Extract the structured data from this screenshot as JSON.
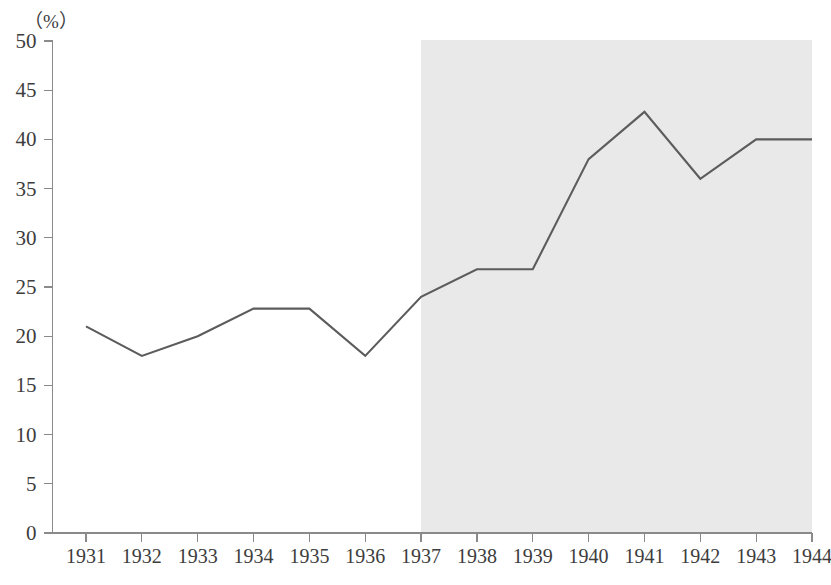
{
  "chart_data": {
    "type": "line",
    "title": "",
    "subtitle": "",
    "xlabel": "",
    "ylabel": "(%)",
    "unit_label": "（%）",
    "categories": [
      "1931",
      "1932",
      "1933",
      "1934",
      "1935",
      "1936",
      "1937",
      "1938",
      "1939",
      "1940",
      "1941",
      "1942",
      "1943",
      "1944"
    ],
    "values": [
      21.0,
      18.0,
      20.0,
      22.8,
      22.8,
      18.0,
      24.0,
      26.8,
      26.8,
      38.0,
      42.8,
      36.0,
      40.0,
      40.0
    ],
    "series": [
      {
        "name": "ratio",
        "values": [
          21.0,
          18.0,
          20.0,
          22.8,
          22.8,
          18.0,
          24.0,
          26.8,
          26.8,
          38.0,
          42.8,
          36.0,
          40.0,
          40.0
        ]
      }
    ],
    "ylim": [
      0,
      50
    ],
    "yticks": [
      0,
      5,
      10,
      15,
      20,
      25,
      30,
      35,
      40,
      45,
      50
    ],
    "ytick_labels": [
      "0",
      "5",
      "10",
      "15",
      "20",
      "25",
      "30",
      "35",
      "40",
      "45",
      "50"
    ],
    "xtick_labels": [
      "1931",
      "1932",
      "1933",
      "1934",
      "1935",
      "1936",
      "1937",
      "1938",
      "1939",
      "1940",
      "1941",
      "1942",
      "1943",
      "1944"
    ],
    "grid": false,
    "legend": null,
    "legend_position": "none",
    "annotations": [
      {
        "type": "shaded-region",
        "name": "wartime-shading",
        "start_category": "1937",
        "end_category": "1944",
        "color": "#e9e9e9",
        "label": ""
      }
    ],
    "colors": {
      "line": "#5c5c5c",
      "axis": "#8a8a8a",
      "text": "#3d3d3d",
      "shading": "#e9e9e9",
      "background": "#ffffff"
    }
  }
}
